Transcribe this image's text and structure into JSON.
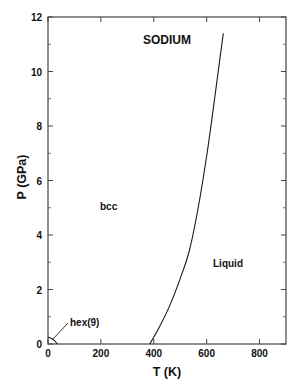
{
  "chart_data": {
    "type": "line",
    "title": "SODIUM",
    "xlabel": "T (K)",
    "ylabel": "P (GPa)",
    "xlim": [
      0,
      900
    ],
    "ylim": [
      0,
      12
    ],
    "grid": false,
    "legend": null,
    "x_ticks": [
      0,
      200,
      400,
      600,
      800
    ],
    "x_tick_labels": [
      "0",
      "200",
      "400",
      "600",
      "800"
    ],
    "x_minor_ticks": [],
    "y_ticks": [
      0,
      2,
      4,
      6,
      8,
      10,
      12
    ],
    "y_tick_labels": [
      "0",
      "2",
      "4",
      "6",
      "8",
      "10",
      "12"
    ],
    "y_minor_ticks": [
      1,
      3,
      5,
      7,
      9,
      11
    ],
    "series": [
      {
        "name": "melting curve",
        "color": "#1a1a1a",
        "x": [
          385,
          420,
          460,
          500,
          535,
          570,
          603,
          630,
          663
        ],
        "y": [
          0,
          0.6,
          1.4,
          2.4,
          3.45,
          5.1,
          7.1,
          9.0,
          11.4
        ]
      },
      {
        "name": "hex(9) boundary",
        "color": "#1a1a1a",
        "x": [
          0,
          10,
          25,
          35
        ],
        "y": [
          0.26,
          0.22,
          0.12,
          0
        ]
      }
    ],
    "annotations": [
      {
        "text": "SODIUM",
        "x": 360,
        "y": 11.2,
        "role": "title"
      },
      {
        "text": "bcc",
        "x": 200,
        "y": 5.1,
        "role": "phase-label"
      },
      {
        "text": "Liquid",
        "x": 720,
        "y": 3.0,
        "role": "phase-label"
      },
      {
        "text": "hex(9)",
        "x": 80,
        "y": 0.85,
        "role": "phase-label",
        "leader_to": [
          12,
          0.15
        ]
      }
    ]
  },
  "labels": {
    "title": "SODIUM",
    "xlabel": "T (K)",
    "ylabel": "P (GPa)",
    "bcc": "bcc",
    "liquid": "Liquid",
    "hex": "hex(9)"
  }
}
